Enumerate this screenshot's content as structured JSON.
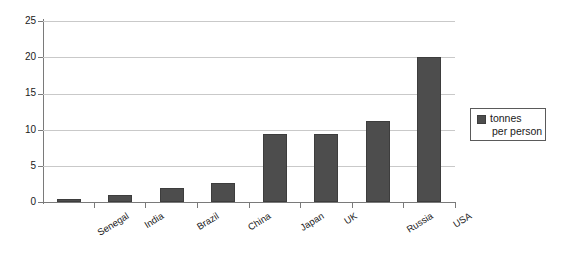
{
  "chart_data": {
    "type": "bar",
    "title": "",
    "subtitle": "",
    "xlabel": "",
    "ylabel": "",
    "categories": [
      "Senegal",
      "India",
      "Brazil",
      "China",
      "Japan",
      "UK",
      "Russia",
      "USA"
    ],
    "values": [
      0.4,
      1.0,
      1.9,
      2.6,
      9.4,
      9.4,
      11.2,
      20.0
    ],
    "series": [
      {
        "name": "tonnes per person",
        "values": [
          0.4,
          1.0,
          1.9,
          2.6,
          9.4,
          9.4,
          11.2,
          20.0
        ],
        "color": "#4d4d4d"
      }
    ],
    "ylim": [
      0,
      25
    ],
    "ytick_labels": [
      "25",
      "20",
      "15",
      "10",
      "5",
      "0"
    ],
    "ytick_values": [
      25,
      20,
      15,
      10,
      5,
      0
    ],
    "grid": true,
    "legend_position": "right",
    "legend_entries": [
      {
        "label_line1": "tonnes",
        "label_line2": "per person",
        "color": "#4d4d4d"
      }
    ]
  },
  "colors": {
    "bar_fill": "#4d4d4d",
    "bar_stroke": "#3d3d3d",
    "gridline": "#c9c9c9",
    "axis": "#7a7a7a",
    "text": "#1a1a1a",
    "background": "#ffffff"
  }
}
